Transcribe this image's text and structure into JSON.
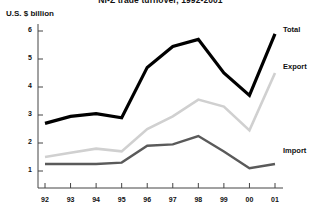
{
  "chart_data": {
    "type": "line",
    "title": "NI-Z trade turnover, 1992-2001",
    "ylabel": "U.S. $ billion",
    "xlabel": "",
    "categories": [
      "92",
      "93",
      "94",
      "95",
      "96",
      "97",
      "98",
      "99",
      "00",
      "01"
    ],
    "x_tick_labels": [
      "92",
      "93",
      "94",
      "95",
      "96",
      "97",
      "98",
      "99",
      "00",
      "01"
    ],
    "y_tick_labels": [
      "1",
      "2",
      "3",
      "4",
      "5",
      "6"
    ],
    "y_tick_values": [
      1,
      2,
      3,
      4,
      5,
      6
    ],
    "ylim": [
      0,
      6.4
    ],
    "grid": false,
    "legend_position": "right-inline",
    "series": [
      {
        "name": "Total",
        "color": "#000000",
        "width": 3.2,
        "label_y": 6.05,
        "values": [
          2.7,
          2.95,
          3.05,
          2.9,
          4.7,
          5.45,
          5.7,
          4.5,
          3.7,
          5.9
        ]
      },
      {
        "name": "Export",
        "color": "#d0d0d0",
        "width": 2.6,
        "label_y": 4.72,
        "values": [
          1.5,
          1.65,
          1.8,
          1.7,
          2.5,
          2.95,
          3.55,
          3.3,
          2.45,
          4.5
        ]
      },
      {
        "name": "Import",
        "color": "#5a5a5a",
        "width": 2.4,
        "label_y": 1.72,
        "values": [
          1.25,
          1.25,
          1.25,
          1.3,
          1.9,
          1.95,
          2.25,
          1.7,
          1.1,
          1.25
        ]
      }
    ]
  },
  "colors": {
    "axis": "#444444",
    "text": "#111111",
    "background": "#ffffff",
    "total": "#000000",
    "export": "#d0d0d0",
    "import": "#5a5a5a"
  }
}
